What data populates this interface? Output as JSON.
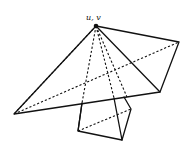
{
  "diagram": {
    "apex_label": "u, v",
    "apex": [
      96,
      26
    ],
    "upper_quad": [
      [
        96,
        26
      ],
      [
        179,
        42
      ],
      [
        160,
        92
      ],
      [
        14,
        114
      ]
    ],
    "lower_quad": [
      [
        82,
        103
      ],
      [
        78,
        131
      ],
      [
        122,
        140
      ],
      [
        131,
        109
      ],
      [
        114,
        98
      ]
    ],
    "dashed_rays_to": [
      [
        14,
        114
      ],
      [
        82,
        103
      ],
      [
        78,
        131
      ],
      [
        114,
        98
      ],
      [
        122,
        140
      ],
      [
        127,
        97
      ]
    ],
    "dashed_diagonals": [
      [
        [
          14,
          114
        ],
        [
          179,
          42
        ]
      ],
      [
        [
          78,
          131
        ],
        [
          131,
          109
        ]
      ]
    ],
    "colors": {
      "stroke": "#111111",
      "background": "#ffffff"
    }
  }
}
